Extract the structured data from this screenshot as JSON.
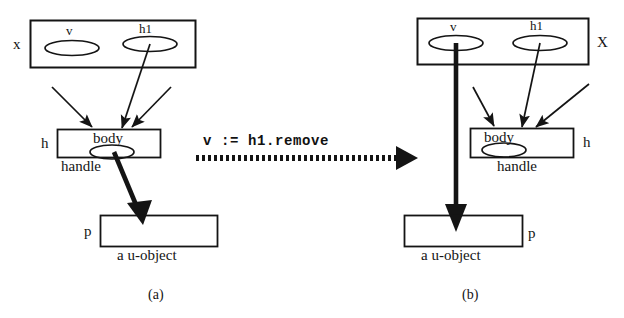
{
  "figure": {
    "caption_a": "(a)",
    "caption_b": "(b)",
    "transition_label": "v := h1.remove"
  },
  "panel_a": {
    "outer_box_label": "x",
    "slot_v_label": "v",
    "slot_h1_label": "h1",
    "handle_box_label": "h",
    "handle_body_label": "body",
    "handle_caption": "handle",
    "object_box_label": "p",
    "object_caption": "a u-object"
  },
  "panel_b": {
    "outer_box_label": "X",
    "slot_v_label": "v",
    "slot_h1_label": "h1",
    "handle_box_label": "h",
    "handle_body_label": "body",
    "handle_caption": "handle",
    "object_box_label": "p",
    "object_caption": "a u-object"
  },
  "colors": {
    "ink": "#141414",
    "background": "#ffffff"
  }
}
